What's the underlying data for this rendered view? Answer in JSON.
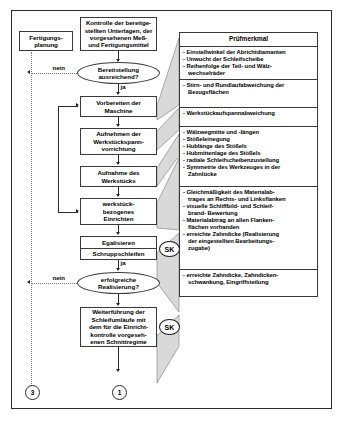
{
  "diagram": {
    "title_row_header": "Prüfmerkmal",
    "nodes": {
      "fertigungsplanung": "Fertigungs-\nplanung",
      "fertigungsplanung_lines": [
        "Fertigungs-",
        "planung"
      ],
      "kontrolle_lines": [
        "Kontrolle der bereitge-",
        "stellten Unterlagen, der",
        "vorgesehenen Meß-",
        "und Fertigungsmittel"
      ],
      "bereitstellung_lines": [
        "Bereitstellung",
        "ausreichend?"
      ],
      "vorbereiten_lines": [
        "Vorbereiten der",
        "Maschine"
      ],
      "aufnehmen_spann_lines": [
        "Aufnehmen der",
        "Werkstückspann-",
        "vorrichtung"
      ],
      "aufnahme_werkstueck_lines": [
        "Aufnahme des",
        "Werkstücks"
      ],
      "werkstueckbezogen_lines": [
        "werkstück-",
        "bezogenes",
        "Einrichten"
      ],
      "egalisieren": "Egalisieren",
      "schruppschleifen": "Schruppschleifen",
      "erfolgreiche_lines": [
        "erfolgreiche",
        "Realisierung?"
      ],
      "weiterfuehrung_lines": [
        "Weiterführung der",
        "Schleifumläufe mit",
        "dem für die Einricht-",
        "kontrolle vorgeseh-",
        "enen Schnittregime"
      ]
    },
    "edge_labels": {
      "nein_top": "nein",
      "ja_top": "ja",
      "nein_bottom": "nein",
      "ja_bottom": "ja"
    },
    "badges": {
      "sk1": "SK",
      "sk2": "SK"
    },
    "connectors": {
      "left": "3",
      "right": "1"
    }
  },
  "table": {
    "header": "Prüfmerkmal",
    "rows": [
      {
        "items": [
          "- Einstellwinkel der Abrichtdiamanten",
          "- Unwucht der Schleifscheibe",
          "- Reihenfolge der Teil- und Wälz-\n  wechselräder"
        ]
      },
      {
        "items": [
          "- Stirn- und Rundlaufabweichung der\n  Bezugsflächen"
        ]
      },
      {
        "items": [
          "- Werkstückaufspannabweichung"
        ]
      },
      {
        "items": [
          "- Wälzwegmitte und -längen",
          "- Stößeleinegung",
          "- Hublänge des Stößels",
          "- Hubmittenlage des Stößels",
          "- radiale Schleifscheibenzustellung",
          "- Symmetrie des Werkzeuges in der\n  Zahnlücke"
        ]
      },
      {
        "items": [
          "- Gleichmäßigkeit des Materialab-\n  trages an Rechts- und Linksflanken",
          "- visuelle Schliffbild- und Schleif-\n  brand- Bewertung",
          "- Materialabtrag an allen Flanken-\n  flächen vorhanden",
          "- erreichte Zahndicke (Realisierung\n  der eingestellten Bearbeitungs-\n  zugabe)"
        ]
      },
      {
        "items": [
          "- erreichte Zahndicke, Zahndicken-\n  schwankung, Eingriffsteilung"
        ]
      }
    ]
  },
  "colors": {
    "line": "#2b2b2b",
    "box_border": "#3a3a3a",
    "fan_fill": "#d9d9d9",
    "fan_stroke": "#8a8a8a",
    "dotted": "#7a7a7a"
  }
}
